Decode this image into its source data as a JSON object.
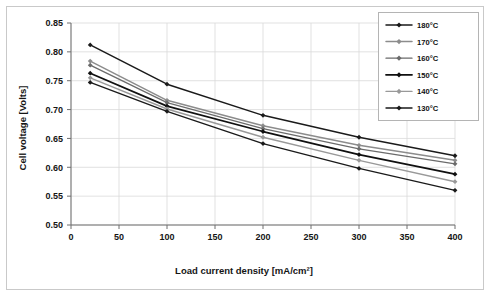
{
  "chart_data": {
    "type": "line",
    "title": "",
    "xlabel": "Load current density [mA/cm²]",
    "ylabel": "Cell voltage [Volts]",
    "xlim": [
      0,
      400
    ],
    "ylim": [
      0.5,
      0.85
    ],
    "xticks": [
      0,
      50,
      100,
      150,
      200,
      250,
      300,
      350,
      400
    ],
    "yticks": [
      0.5,
      0.55,
      0.6,
      0.65,
      0.7,
      0.75,
      0.8,
      0.85
    ],
    "xtick_labels": [
      "0",
      "50",
      "100",
      "150",
      "200",
      "250",
      "300",
      "350",
      "400"
    ],
    "ytick_labels": [
      "0.50",
      "0.55",
      "0.60",
      "0.65",
      "0.70",
      "0.75",
      "0.80",
      "0.85"
    ],
    "grid": true,
    "legend_position": "top-right",
    "x": [
      20,
      100,
      200,
      300,
      400
    ],
    "series": [
      {
        "name": "180°C",
        "color": "#1a1a1a",
        "width": 1.5,
        "values": [
          0.812,
          0.744,
          0.69,
          0.652,
          0.62
        ]
      },
      {
        "name": "170°C",
        "color": "#8c8c8c",
        "width": 1.5,
        "values": [
          0.784,
          0.716,
          0.672,
          0.638,
          0.612
        ]
      },
      {
        "name": "160°C",
        "color": "#6b6b6b",
        "width": 1.3,
        "values": [
          0.777,
          0.712,
          0.667,
          0.632,
          0.606
        ]
      },
      {
        "name": "150°C",
        "color": "#101010",
        "width": 1.8,
        "values": [
          0.763,
          0.706,
          0.662,
          0.622,
          0.588
        ]
      },
      {
        "name": "140°C",
        "color": "#999999",
        "width": 1.4,
        "values": [
          0.755,
          0.701,
          0.652,
          0.612,
          0.575
        ]
      },
      {
        "name": "130°C",
        "color": "#1a1a1a",
        "width": 1.4,
        "values": [
          0.747,
          0.697,
          0.641,
          0.598,
          0.56
        ]
      }
    ]
  }
}
